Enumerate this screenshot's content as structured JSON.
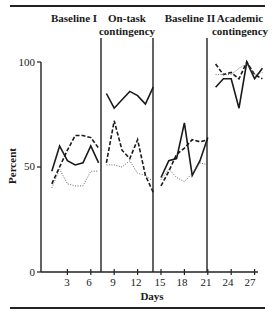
{
  "chart_data": {
    "type": "line",
    "title": "",
    "xlabel": "Days",
    "ylabel": "Percent",
    "ylim": [
      0,
      100
    ],
    "xlim": [
      0,
      28
    ],
    "grid": false,
    "legend": null,
    "y_ticks": [
      "0",
      "50",
      "100"
    ],
    "x_ticks": [
      "3",
      "6",
      "9",
      "12",
      "15",
      "18",
      "21",
      "24",
      "27"
    ],
    "phases": [
      {
        "label_line1": "Baseline I",
        "label_line2": "",
        "start_day": 0.5,
        "end_day": 7.5
      },
      {
        "label_line1": "On-task",
        "label_line2": "contingency",
        "start_day": 7.5,
        "end_day": 14.5
      },
      {
        "label_line1": "Baseline II",
        "label_line2": "",
        "start_day": 14.5,
        "end_day": 21.5
      },
      {
        "label_line1": "Academic",
        "label_line2": "contingency",
        "start_day": 21.5,
        "end_day": 28
      }
    ],
    "phase_boundaries": [
      7.5,
      14.5,
      21.5
    ],
    "series": [
      {
        "name": "solid",
        "style": "solid",
        "segments": [
          {
            "x": [
              1,
              2,
              3,
              4,
              5,
              6,
              7
            ],
            "y": [
              48,
              60,
              53,
              51,
              52,
              60,
              52
            ]
          },
          {
            "x": [
              8,
              9,
              10,
              11,
              12,
              13,
              14
            ],
            "y": [
              85,
              78,
              82,
              86,
              84,
              80,
              88
            ]
          },
          {
            "x": [
              15,
              16,
              17,
              18,
              19,
              20,
              21
            ],
            "y": [
              45,
              53,
              54,
              71,
              46,
              53,
              64
            ]
          },
          {
            "x": [
              22,
              23,
              24,
              25,
              26,
              27,
              28
            ],
            "y": [
              88,
              92,
              92,
              78,
              100,
              92,
              97
            ]
          }
        ]
      },
      {
        "name": "dashed",
        "style": "dashed",
        "segments": [
          {
            "x": [
              1,
              2,
              3,
              4,
              5,
              6,
              7
            ],
            "y": [
              42,
              50,
              58,
              65,
              65,
              64,
              59
            ]
          },
          {
            "x": [
              8,
              9,
              10,
              11,
              12,
              13,
              14
            ],
            "y": [
              52,
              72,
              58,
              54,
              63,
              46,
              38
            ]
          },
          {
            "x": [
              15,
              16,
              17,
              18,
              19,
              20,
              21
            ],
            "y": [
              41,
              48,
              56,
              59,
              63,
              62,
              63
            ]
          },
          {
            "x": [
              22,
              23,
              24,
              25,
              26,
              27,
              28
            ],
            "y": [
              99,
              94,
              95,
              92,
              100,
              94,
              92
            ]
          }
        ]
      },
      {
        "name": "dotted",
        "style": "dotted",
        "segments": [
          {
            "x": [
              1,
              2,
              3,
              4,
              5,
              6,
              7
            ],
            "y": [
              40,
              49,
              42,
              41,
              41,
              48,
              48
            ]
          },
          {
            "x": [
              8,
              9,
              10,
              11,
              12,
              13,
              14
            ],
            "y": [
              51,
              51,
              50,
              53,
              47,
              46,
              43
            ]
          },
          {
            "x": [
              15,
              16,
              17,
              18,
              19,
              20,
              21
            ],
            "y": [
              44,
              49,
              45,
              43,
              47,
              52,
              51
            ]
          },
          {
            "x": [
              22,
              23,
              24,
              25,
              26,
              27,
              28
            ],
            "y": [
              94,
              94,
              94,
              97,
              99,
              94,
              95
            ]
          }
        ]
      }
    ]
  }
}
